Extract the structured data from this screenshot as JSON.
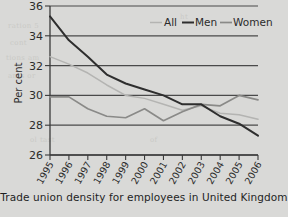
{
  "caption": "Trade union density for employees in United Kingdom",
  "legend": {
    "position": "top-right",
    "entries": [
      {
        "label": "All",
        "color": "#b4b4b2"
      },
      {
        "label": "Men",
        "color": "#2e2e2e"
      },
      {
        "label": "Women",
        "color": "#8a8a88"
      }
    ]
  },
  "axes": {
    "ylabel": "Per cent",
    "xlabel": "",
    "yticks": [
      "26",
      "28",
      "30",
      "32",
      "34",
      "36"
    ],
    "xticks": [
      "1995",
      "1996",
      "1997",
      "1998",
      "1999",
      "2000",
      "2001",
      "2002",
      "2003",
      "2004",
      "2005",
      "2006"
    ]
  },
  "chart_data": {
    "type": "line",
    "title": "",
    "subtitle": "",
    "xlabel": "",
    "ylabel": "Per cent",
    "categories": [
      "1995",
      "1996",
      "1997",
      "1998",
      "1999",
      "2000",
      "2001",
      "2002",
      "2003",
      "2004",
      "2005",
      "2006"
    ],
    "x": [
      1995,
      1996,
      1997,
      1998,
      1999,
      2000,
      2001,
      2002,
      2003,
      2004,
      2005,
      2006
    ],
    "ylim": [
      26,
      36
    ],
    "xlim": [
      1995,
      2006
    ],
    "yticks": [
      26,
      28,
      30,
      32,
      34,
      36
    ],
    "grid": "horizontal",
    "legend_position": "top-right",
    "series": [
      {
        "name": "All",
        "color": "#b4b4b2",
        "values": [
          32.6,
          32.1,
          31.5,
          30.7,
          30.0,
          29.8,
          29.4,
          29.0,
          29.3,
          28.8,
          28.7,
          28.4
        ]
      },
      {
        "name": "Men",
        "color": "#2e2e2e",
        "values": [
          35.3,
          33.7,
          32.6,
          31.4,
          30.8,
          30.4,
          30.0,
          29.4,
          29.4,
          28.6,
          28.1,
          27.3
        ]
      },
      {
        "name": "Women",
        "color": "#8a8a88",
        "values": [
          29.9,
          29.9,
          29.1,
          28.6,
          28.5,
          29.1,
          28.3,
          28.9,
          29.4,
          29.3,
          30.0,
          29.7
        ]
      }
    ]
  },
  "bleed_marks": [
    {
      "text": "ration 5",
      "x": 8,
      "y": 22
    },
    {
      "text": "cont",
      "x": 10,
      "y": 39
    },
    {
      "text": "tions am",
      "x": 6,
      "y": 54
    },
    {
      "text": "ants or",
      "x": 8,
      "y": 72
    },
    {
      "text": "ol tast",
      "x": 30,
      "y": 136
    },
    {
      "text": "of",
      "x": 150,
      "y": 136
    },
    {
      "text": "ht",
      "x": 180,
      "y": 13
    }
  ]
}
